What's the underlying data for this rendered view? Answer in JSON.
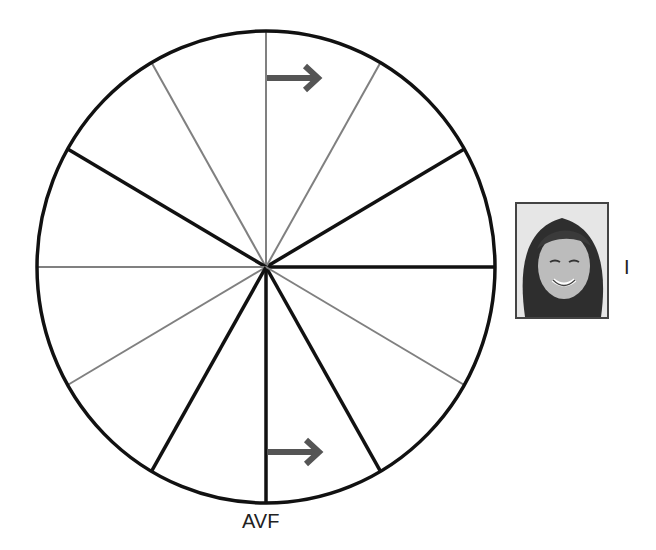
{
  "diagram": {
    "center": [
      266,
      267
    ],
    "radius_x": 229,
    "radius_y": 236,
    "colors": {
      "bold_line": "#111111",
      "thin_line": "#808080",
      "arrow": "#555555"
    },
    "spokes": [
      {
        "angle": 0,
        "style": "bold"
      },
      {
        "angle": 30,
        "style": "bold"
      },
      {
        "angle": 60,
        "style": "thin"
      },
      {
        "angle": 90,
        "style": "thin"
      },
      {
        "angle": 120,
        "style": "thin"
      },
      {
        "angle": 150,
        "style": "bold"
      },
      {
        "angle": 180,
        "style": "thin"
      },
      {
        "angle": 210,
        "style": "thin"
      },
      {
        "angle": 240,
        "style": "bold"
      },
      {
        "angle": 270,
        "style": "bold"
      },
      {
        "angle": 300,
        "style": "bold"
      },
      {
        "angle": 330,
        "style": "thin"
      }
    ],
    "arrows": [
      {
        "name": "top-arrow",
        "direction": "right",
        "y": 78
      },
      {
        "name": "bottom-arrow",
        "direction": "right",
        "y": 452
      }
    ]
  },
  "labels": {
    "avf": "AVF",
    "lead_i": "I"
  },
  "photo": {
    "description": "smiling woman portrait"
  }
}
